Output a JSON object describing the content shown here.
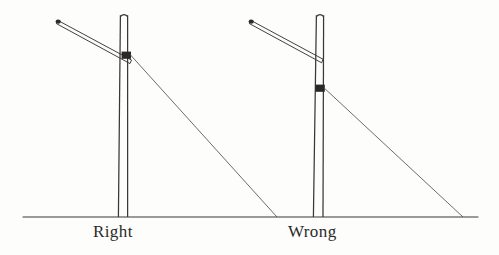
{
  "figure": {
    "background_color": "#fdfdfc",
    "ink_color": "#3a3834",
    "ground_line": {
      "label": "ground-line",
      "x1": 23,
      "y1": 217,
      "x2": 478,
      "y2": 217
    },
    "captions": {
      "right": "Right",
      "wrong": "Wrong"
    },
    "assemblies": [
      {
        "id": "right-assembly",
        "caption": "Right",
        "mast": {
          "label": "mast",
          "top_y": 15,
          "base_y": 217,
          "top_left_x": 120,
          "top_right_x": 128,
          "base_left_x": 118,
          "base_right_x": 128
        },
        "gaff": {
          "label": "gaff-spar",
          "tip_x": 57,
          "tip_y": 21,
          "heel_x": 131,
          "heel_y": 62,
          "thickness": 4
        },
        "fitting": {
          "label": "stay-band-fitting",
          "x": 122,
          "y": 52,
          "w": 9,
          "h": 7
        },
        "stay": {
          "label": "stay-line",
          "x1": 130,
          "y1": 55,
          "x2": 277,
          "y2": 217
        }
      },
      {
        "id": "wrong-assembly",
        "caption": "Wrong",
        "mast": {
          "label": "mast",
          "top_y": 15,
          "base_y": 217,
          "top_left_x": 316,
          "top_right_x": 324,
          "base_left_x": 313,
          "base_right_x": 323
        },
        "gaff": {
          "label": "gaff-spar",
          "tip_x": 250,
          "tip_y": 21,
          "heel_x": 322,
          "heel_y": 61,
          "thickness": 4
        },
        "fitting": {
          "label": "stay-band-fitting",
          "x": 316,
          "y": 85,
          "w": 9,
          "h": 7
        },
        "stay": {
          "label": "stay-line",
          "x1": 324,
          "y1": 88,
          "x2": 463,
          "y2": 217
        }
      }
    ]
  }
}
